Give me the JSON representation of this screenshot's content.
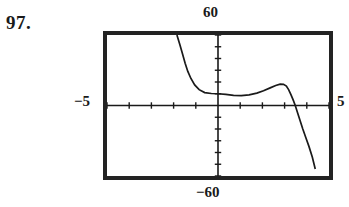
{
  "figure": {
    "exercise_number": "97.",
    "window_labels": {
      "top": "60",
      "bottom": "−60",
      "left": "−5",
      "right": "5"
    },
    "colors": {
      "frame": "#232323",
      "curve": "#1a1a1a",
      "axis": "#1a1a1a",
      "background": "#ffffff",
      "text": "#1a1a1a"
    }
  },
  "chart_data": {
    "type": "line",
    "title": "",
    "subtitle": "",
    "xlabel": "",
    "ylabel": "",
    "xlim": [
      -5,
      5
    ],
    "ylim": [
      -60,
      60
    ],
    "xtick_step": 1,
    "ytick_step": 10,
    "grid": false,
    "legend": "none",
    "tick_labels": {
      "x": [
        "-5",
        "5"
      ],
      "y": [
        "-60",
        "60"
      ]
    },
    "annotations": [
      "97."
    ],
    "series": [
      {
        "name": "curve",
        "x": [
          -1.85,
          -1.72,
          -1.6,
          -1.48,
          -1.36,
          -1.22,
          -1.05,
          -0.85,
          -0.6,
          -0.3,
          0.0,
          0.35,
          0.7,
          1.05,
          1.4,
          1.75,
          2.05,
          2.35,
          2.6,
          2.8,
          2.95,
          3.08,
          3.18,
          3.28,
          3.38,
          3.48,
          3.58,
          3.7,
          3.82,
          3.95,
          4.1,
          4.25,
          4.38
        ],
        "y": [
          60.0,
          52.0,
          44.0,
          36.0,
          29.0,
          23.0,
          17.5,
          13.5,
          11.0,
          10.2,
          10.0,
          9.4,
          8.6,
          8.4,
          9.0,
          10.5,
          12.5,
          15.0,
          17.0,
          18.2,
          18.0,
          16.5,
          13.5,
          9.5,
          5.0,
          0.0,
          -6.0,
          -13.0,
          -20.0,
          -27.0,
          -35.0,
          -44.0,
          -54.0
        ]
      }
    ]
  }
}
